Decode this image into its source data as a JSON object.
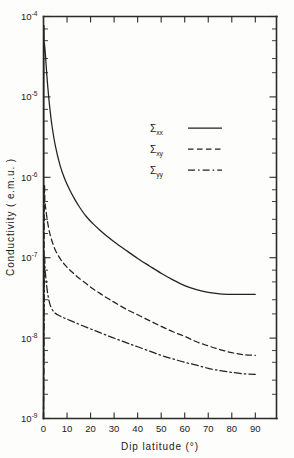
{
  "chart_data": {
    "type": "line",
    "title": "",
    "xlabel": "Dip  latitude  (°)",
    "ylabel": "Conductivity  ( e.m.u. )",
    "xlim": [
      0,
      99
    ],
    "ylim_exponents": [
      -9,
      -4
    ],
    "y_scale": "log",
    "grid": false,
    "legend_position": "upper-center-right",
    "x_ticks": [
      0,
      10,
      20,
      30,
      40,
      50,
      60,
      70,
      80,
      90
    ],
    "x_tick_labels": [
      "0",
      "10",
      "20",
      "30",
      "40",
      "50",
      "60",
      "70",
      "80",
      "90"
    ],
    "y_tick_labels": [
      "10-4",
      "10-5",
      "10-6",
      "10-7",
      "10-8",
      "10-9"
    ],
    "y_tick_mantissa": "10",
    "y_tick_exponents": [
      "-4",
      "-5",
      "-6",
      "-7",
      "-8",
      "-9"
    ],
    "series": [
      {
        "name": "Sigma_xx",
        "label": "Σ",
        "sub": "xx",
        "style": "solid",
        "x": [
          0.0,
          0.15,
          0.3,
          0.5,
          0.8,
          1.2,
          1.8,
          2.5,
          3.5,
          5,
          7,
          9,
          11,
          13,
          15,
          18,
          21,
          24,
          27,
          30,
          35,
          40,
          45,
          50,
          55,
          60,
          65,
          70,
          75,
          80,
          85,
          90
        ],
        "y": [
          1e-09,
          3.2e-05,
          4.6e-05,
          4.3e-05,
          3.4e-05,
          2.3e-05,
          1.35e-05,
          8.2e-06,
          4.6e-06,
          2.5e-06,
          1.42e-06,
          9.6e-07,
          7.1e-07,
          5.5e-07,
          4.4e-07,
          3.3e-07,
          2.65e-07,
          2.2e-07,
          1.85e-07,
          1.58e-07,
          1.24e-07,
          9.8e-08,
          7.9e-08,
          6.4e-08,
          5.3e-08,
          4.5e-08,
          4e-08,
          3.7e-08,
          3.55e-08,
          3.5e-08,
          3.5e-08,
          3.5e-08
        ]
      },
      {
        "name": "Sigma_xy",
        "label": "Σ",
        "sub": "xy",
        "style": "dashed",
        "x": [
          0.0,
          0.35,
          0.6,
          0.9,
          1.3,
          1.9,
          2.6,
          3.5,
          5,
          7,
          9,
          11,
          13,
          15,
          18,
          21,
          24,
          27,
          30,
          35,
          40,
          45,
          50,
          55,
          60,
          65,
          70,
          75,
          80,
          85,
          90
        ],
        "y": [
          1e-09,
          5.1e-07,
          4.8e-07,
          4.2e-07,
          3.4e-07,
          2.6e-07,
          2.05e-07,
          1.65e-07,
          1.25e-07,
          9.8e-08,
          8.2e-08,
          7.1e-08,
          6.3e-08,
          5.6e-08,
          4.8e-08,
          4.1e-08,
          3.6e-08,
          3.15e-08,
          2.8e-08,
          2.3e-08,
          1.95e-08,
          1.65e-08,
          1.4e-08,
          1.2e-08,
          1.05e-08,
          9e-09,
          8e-09,
          7.2e-09,
          6.6e-09,
          6.2e-09,
          6.1e-09
        ]
      },
      {
        "name": "Sigma_yy",
        "label": "Σ",
        "sub": "yy",
        "style": "dashdot",
        "x": [
          0.0,
          0.4,
          0.7,
          1.1,
          1.6,
          2.3,
          3.2,
          4.5,
          6,
          8,
          10,
          13,
          16,
          20,
          24,
          28,
          32,
          36,
          40,
          45,
          50,
          55,
          60,
          65,
          70,
          75,
          80,
          85,
          90
        ],
        "y": [
          1e-09,
          7.6e-08,
          6.8e-08,
          5.3e-08,
          3.9e-08,
          2.95e-08,
          2.42e-08,
          2.1e-08,
          1.95e-08,
          1.82e-08,
          1.72e-08,
          1.58e-08,
          1.45e-08,
          1.3e-08,
          1.17e-08,
          1.05e-08,
          9.5e-09,
          8.6e-09,
          7.8e-09,
          6.9e-09,
          6.1e-09,
          5.5e-09,
          5e-09,
          4.6e-09,
          4.2e-09,
          3.95e-09,
          3.75e-09,
          3.6e-09,
          3.55e-09
        ]
      }
    ]
  },
  "legend": {
    "entries": [
      {
        "label": "Σ",
        "sub": "xx",
        "style": "solid"
      },
      {
        "label": "Σ",
        "sub": "xy",
        "style": "dashed"
      },
      {
        "label": "Σ",
        "sub": "yy",
        "style": "dashdot"
      }
    ]
  },
  "axes": {
    "x_title": "Dip  latitude  (°)",
    "y_title": "Conductivity  ( e.m.u. )"
  }
}
